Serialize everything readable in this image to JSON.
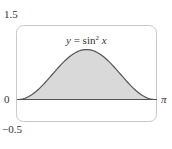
{
  "chart_data": {
    "type": "area",
    "title_parts": {
      "y": "y",
      "eq": " = sin",
      "sup": "2",
      "x": " x"
    },
    "function": "sin^2(x)",
    "xlabel": "",
    "ylabel": "",
    "xlim": [
      0,
      3.14159
    ],
    "ylim": [
      -0.5,
      1.5
    ],
    "x_tick_labels": [
      "0",
      "π"
    ],
    "y_tick_labels": [
      "1.5",
      "0",
      "−0.5"
    ],
    "grid": false,
    "legend": null,
    "fill_color": "#d9d9d9",
    "line_color": "#555555",
    "frame_color": "#c8c8c8",
    "x": [
      0,
      0.3927,
      0.7854,
      1.1781,
      1.5708,
      1.9635,
      2.3562,
      2.7489,
      3.1416
    ],
    "values": [
      0,
      0.1464,
      0.5,
      0.8536,
      1.0,
      0.8536,
      0.5,
      0.1464,
      0
    ]
  },
  "labels": {
    "y_top": "1.5",
    "y_zero": "0",
    "y_bottom": "−0.5",
    "x_end": "π"
  }
}
